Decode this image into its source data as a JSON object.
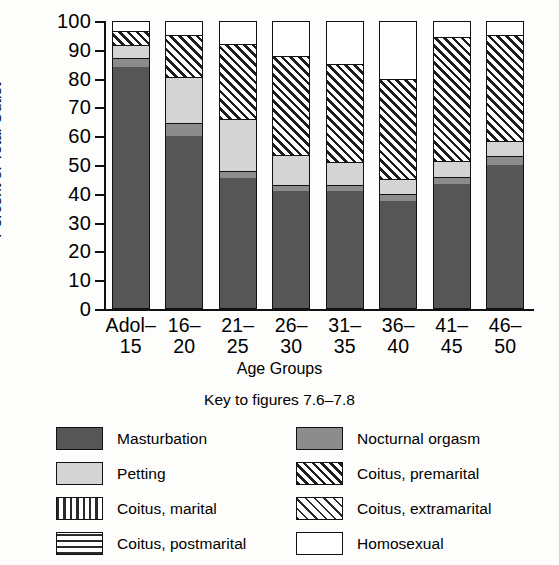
{
  "chart_data": {
    "type": "bar",
    "subtype": "stacked-bar-100percent",
    "title": "",
    "xlabel": "Age Groups",
    "ylabel": "Percent of Total Outlet",
    "ylim": [
      0,
      100
    ],
    "ytick_values": [
      0,
      10,
      20,
      30,
      40,
      50,
      60,
      70,
      80,
      90,
      100
    ],
    "ytick_labels": [
      "0",
      "10",
      "20",
      "30",
      "40",
      "50",
      "60",
      "70",
      "80",
      "90",
      "100"
    ],
    "grid": false,
    "legend_position": "below",
    "legend_title": "Key to figures 7.6–7.8",
    "categories": [
      {
        "line1": "Adol–",
        "line2": "15"
      },
      {
        "line1": "16–",
        "line2": "20"
      },
      {
        "line1": "21–",
        "line2": "25"
      },
      {
        "line1": "26–",
        "line2": "30"
      },
      {
        "line1": "31–",
        "line2": "35"
      },
      {
        "line1": "36–",
        "line2": "40"
      },
      {
        "line1": "41–",
        "line2": "45"
      },
      {
        "line1": "46–",
        "line2": "50"
      }
    ],
    "series": [
      {
        "name": "Masturbation",
        "key": "mast",
        "values": [
          84.0,
          60.0,
          45.5,
          41.0,
          41.0,
          37.5,
          43.5,
          50.0
        ]
      },
      {
        "name": "Nocturnal orgasm",
        "key": "noct",
        "values": [
          3.0,
          4.5,
          2.5,
          2.0,
          2.0,
          2.5,
          2.5,
          3.0
        ]
      },
      {
        "name": "Petting",
        "key": "pett",
        "values": [
          4.5,
          16.0,
          18.0,
          10.5,
          8.0,
          5.0,
          5.5,
          5.5
        ]
      },
      {
        "name": "Coitus, premarital",
        "key": "pre",
        "values": [
          5.0,
          14.5,
          26.0,
          34.5,
          34.0,
          35.0,
          43.0,
          36.5
        ]
      },
      {
        "name": "Homosexual",
        "key": "homo",
        "values": [
          3.5,
          5.0,
          8.0,
          12.0,
          15.0,
          20.0,
          5.5,
          5.0
        ]
      },
      {
        "name": "Coitus, marital",
        "key": "marital",
        "values": [
          0,
          0,
          0,
          0,
          0,
          0,
          0,
          0
        ]
      },
      {
        "name": "Coitus, extramarital",
        "key": "extra",
        "values": [
          0,
          0,
          0,
          0,
          0,
          0,
          0,
          0
        ]
      },
      {
        "name": "Coitus, postmarital",
        "key": "post",
        "values": [
          0,
          0,
          0,
          0,
          0,
          0,
          0,
          0
        ]
      }
    ],
    "stack_order": [
      "mast",
      "noct",
      "pett",
      "pre",
      "homo"
    ],
    "cumulative_tops": [
      {
        "category": "Adol–15",
        "mast": 84.0,
        "noct": 87.0,
        "pett": 91.5,
        "pre": 96.5,
        "homo": 100
      },
      {
        "category": "16–20",
        "mast": 60.0,
        "noct": 64.5,
        "pett": 80.5,
        "pre": 95.0,
        "homo": 100
      },
      {
        "category": "21–25",
        "mast": 45.5,
        "noct": 48.0,
        "pett": 66.0,
        "pre": 92.0,
        "homo": 100
      },
      {
        "category": "26–30",
        "mast": 41.0,
        "noct": 43.0,
        "pett": 53.5,
        "pre": 88.0,
        "homo": 100
      },
      {
        "category": "31–35",
        "mast": 41.0,
        "noct": 43.0,
        "pett": 51.0,
        "pre": 85.0,
        "homo": 100
      },
      {
        "category": "36–40",
        "mast": 37.5,
        "noct": 40.0,
        "pett": 45.0,
        "pre": 80.0,
        "homo": 100
      },
      {
        "category": "41–45",
        "mast": 43.5,
        "noct": 46.0,
        "pett": 51.5,
        "pre": 94.5,
        "homo": 100
      },
      {
        "category": "46–50",
        "mast": 50.0,
        "noct": 53.0,
        "pett": 58.5,
        "pre": 95.0,
        "homo": 100
      }
    ]
  },
  "axes": {
    "y_title": "Percent of Total Outlet",
    "x_title": "Age Groups",
    "yticks": [
      "100",
      "90",
      "80",
      "70",
      "60",
      "50",
      "40",
      "30",
      "20",
      "10",
      "0"
    ]
  },
  "key": {
    "title": "Key to figures 7.6–7.8",
    "entries": [
      {
        "label": "Masturbation",
        "swatch": "solid-dark-gray"
      },
      {
        "label": "Nocturnal orgasm",
        "swatch": "solid-medium-gray"
      },
      {
        "label": "Petting",
        "swatch": "solid-light-gray"
      },
      {
        "label": "Coitus, premarital",
        "swatch": "dense-diagonal-hatch"
      },
      {
        "label": "Coitus, marital",
        "swatch": "vertical-stripes"
      },
      {
        "label": "Coitus, extramarital",
        "swatch": "sparse-diagonal-hatch"
      },
      {
        "label": "Coitus, postmarital",
        "swatch": "horizontal-stripes"
      },
      {
        "label": "Homosexual",
        "swatch": "white-empty"
      }
    ]
  },
  "colors": {
    "masturbation": "#565656",
    "nocturnal": "#8c8c8c",
    "petting": "#d4d4d4",
    "homosexual": "#ffffff",
    "ink": "#111111",
    "background": "#fdfdfb"
  }
}
